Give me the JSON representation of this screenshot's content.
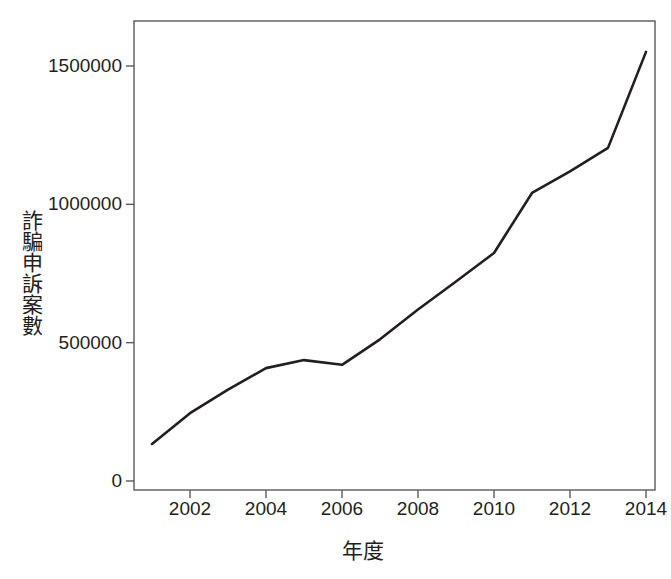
{
  "chart_data": {
    "type": "line",
    "title": "",
    "subtitle": "",
    "xlabel": "年度",
    "ylabel": "詐騙申訴案數",
    "x": [
      2001,
      2002,
      2003,
      2004,
      2005,
      2006,
      2007,
      2008,
      2009,
      2010,
      2011,
      2012,
      2013,
      2014
    ],
    "values": [
      134000,
      245000,
      330000,
      408000,
      437000,
      420000,
      512000,
      620000,
      721000,
      824000,
      1041000,
      1119000,
      1204000,
      1551000
    ],
    "series": [
      {
        "name": "詐騙申訴案數",
        "values": [
          134000,
          245000,
          330000,
          408000,
          437000,
          420000,
          512000,
          620000,
          721000,
          824000,
          1041000,
          1119000,
          1204000,
          1551000
        ]
      }
    ],
    "xlim": [
      2000.5,
      2014.5
    ],
    "ylim": [
      -55000,
      1620000
    ],
    "xticks": [
      2002,
      2004,
      2006,
      2008,
      2010,
      2012,
      2014
    ],
    "xtick_labels": [
      "2002",
      "2004",
      "2006",
      "2008",
      "2010",
      "2012",
      "2014"
    ],
    "yticks": [
      0,
      500000,
      1000000,
      1500000
    ],
    "ytick_labels": [
      "0",
      "500000",
      "1000000",
      "1500000"
    ],
    "grid": false,
    "legend": "none",
    "line_color": "#231f20",
    "line_width": 2.6,
    "frame_color": "#58595b",
    "background": "#ffffff"
  }
}
